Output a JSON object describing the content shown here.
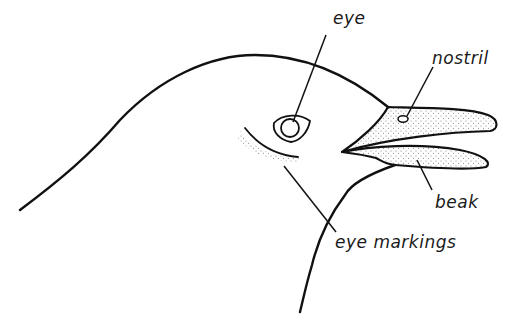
{
  "diagram": {
    "colors": {
      "ink": "#111111",
      "stipple": "#8a8a8a",
      "background": "#ffffff"
    },
    "labels": [
      {
        "id": "eye",
        "text": "eye",
        "x": 333,
        "y": 8
      },
      {
        "id": "nostril",
        "text": "nostril",
        "x": 432,
        "y": 48
      },
      {
        "id": "beak",
        "text": "beak",
        "x": 435,
        "y": 192
      },
      {
        "id": "eye-markings",
        "text": "eye markings",
        "x": 335,
        "y": 232
      }
    ]
  }
}
